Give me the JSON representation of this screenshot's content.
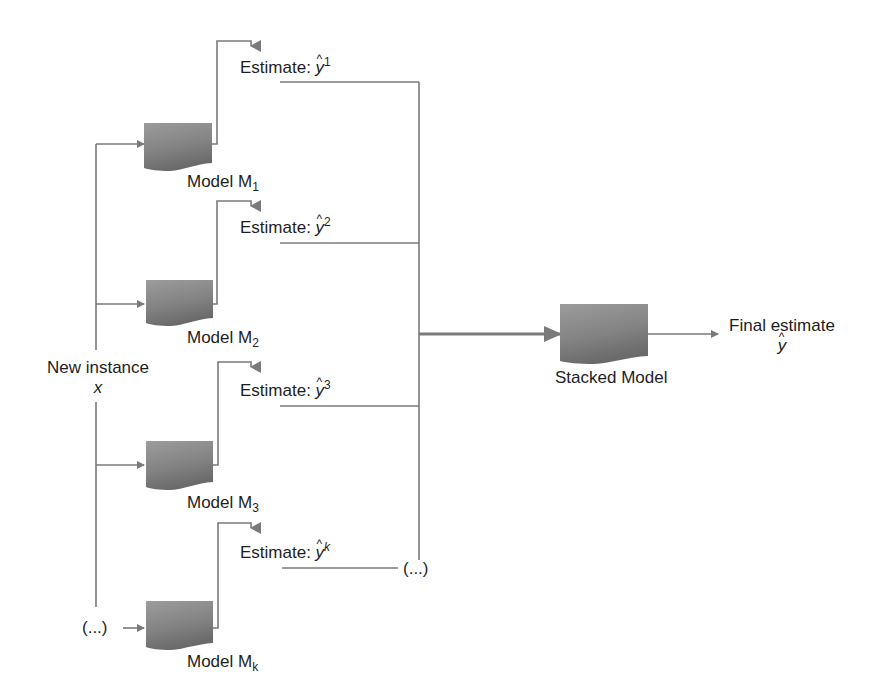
{
  "diagram": {
    "type": "stacking-ensemble-flow",
    "input": {
      "label": "New instance",
      "variable": "x",
      "continuation": "(...)"
    },
    "models": [
      {
        "label": "Model M",
        "subscript": "1",
        "estimate_prefix": "Estimate: ",
        "estimate_symbol": "y",
        "estimate_superscript": "1"
      },
      {
        "label": "Model M",
        "subscript": "2",
        "estimate_prefix": "Estimate: ",
        "estimate_symbol": "y",
        "estimate_superscript": "2"
      },
      {
        "label": "Model M",
        "subscript": "3",
        "estimate_prefix": "Estimate: ",
        "estimate_symbol": "y",
        "estimate_superscript": "3"
      },
      {
        "label": "Model M",
        "subscript": "k",
        "estimate_prefix": "Estimate: ",
        "estimate_symbol": "y",
        "estimate_superscript": "k"
      }
    ],
    "estimates_continuation": "(...)",
    "stacked_model": {
      "label": "Stacked Model"
    },
    "output": {
      "label": "Final estimate",
      "symbol": "y"
    },
    "colors": {
      "line": "#7a7a7a",
      "box_light": "#9a9a9a",
      "box_dark": "#6a6a6a",
      "text": "#1e1e1e"
    }
  }
}
